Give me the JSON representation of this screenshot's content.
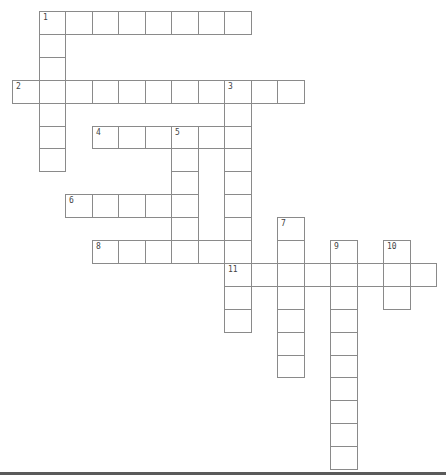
{
  "puzzle": {
    "type": "crossword",
    "grid": {
      "origin_x": 12,
      "origin_y": 11,
      "cell_width": 26.5,
      "cell_height": 22.9
    },
    "border_color": "#8a8a8a",
    "words": [
      {
        "number": "1",
        "direction": "across",
        "row": 0,
        "col": 1,
        "length": 8
      },
      {
        "number": "1",
        "direction": "down",
        "row": 0,
        "col": 1,
        "length": 7
      },
      {
        "number": "2",
        "direction": "across",
        "row": 3,
        "col": 0,
        "length": 11
      },
      {
        "number": "3",
        "direction": "down",
        "row": 3,
        "col": 8,
        "length": 11
      },
      {
        "number": "4",
        "direction": "across",
        "row": 5,
        "col": 3,
        "length": 6
      },
      {
        "number": "5",
        "direction": "down",
        "row": 5,
        "col": 6,
        "length": 6
      },
      {
        "number": "6",
        "direction": "across",
        "row": 8,
        "col": 2,
        "length": 5
      },
      {
        "number": "7",
        "direction": "down",
        "row": 9,
        "col": 10,
        "length": 7
      },
      {
        "number": "8",
        "direction": "across",
        "row": 10,
        "col": 3,
        "length": 6
      },
      {
        "number": "9",
        "direction": "down",
        "row": 10,
        "col": 12,
        "length": 10
      },
      {
        "number": "10",
        "direction": "down",
        "row": 10,
        "col": 14,
        "length": 3
      },
      {
        "number": "11",
        "direction": "across",
        "row": 11,
        "col": 8,
        "length": 8
      }
    ]
  }
}
